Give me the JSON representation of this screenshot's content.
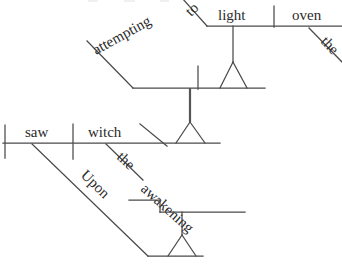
{
  "diagram": {
    "kind": "reed-kellogg-sentence-diagram",
    "sentence": "Upon the awakening the witch saw attempting to light the oven",
    "background_color": "#ffffff",
    "line_color": "#4a4a4a",
    "text_color": "#2b2b2b",
    "canvas": {
      "width": 342,
      "height": 265
    },
    "words": {
      "to": "to",
      "light": "light",
      "oven": "oven",
      "the_oven_article": "the",
      "attempting": "attempting",
      "saw": "saw",
      "witch": "witch",
      "the_witch_article": "the",
      "awakening": "awakening",
      "upon": "Upon"
    },
    "levels": [
      {
        "name": "top-infinitive-clause",
        "baseline_y": 22,
        "items": [
          "to",
          "light",
          "oven",
          "the"
        ]
      },
      {
        "name": "participial-clause",
        "baseline_y": 88,
        "items": [
          "attempting"
        ]
      },
      {
        "name": "main-clause",
        "baseline_y": 143,
        "items": [
          "the",
          "witch",
          "saw"
        ]
      },
      {
        "name": "prepositional-phrase",
        "baseline_y": 212,
        "items": [
          "Upon",
          "the",
          "awakening"
        ]
      }
    ]
  }
}
